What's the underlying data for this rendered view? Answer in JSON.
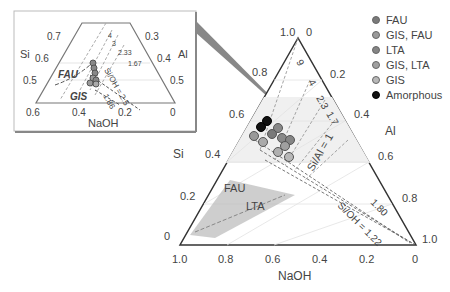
{
  "main": {
    "axis_left_label": "Si",
    "axis_right_label": "Al",
    "axis_bottom_label": "NaOH",
    "bottom_ticks": [
      "1.0",
      "0.8",
      "0.6",
      "0.4",
      "0.2",
      "0"
    ],
    "left_ticks": [
      "0",
      "0.2",
      "0.4",
      "0.6",
      "0.8",
      "1.0"
    ],
    "right_ticks": [
      "0",
      "0.2",
      "0.4",
      "0.6",
      "0.8",
      "1.0"
    ],
    "si_al_labels": [
      "9",
      "4",
      "2.3",
      "1.7"
    ],
    "si_al_eq": "Si/Al = 1",
    "si_oh_labels": [
      "1.80"
    ],
    "si_oh_eq": "Si/OH = 1.22",
    "region_fau": "FAU",
    "region_lta": "LTA"
  },
  "inset": {
    "axis_left_label": "Si",
    "axis_right_label": "Al",
    "axis_bottom_label": "NaOH",
    "bottom_ticks": [
      "0.6",
      "0.4",
      "0.2",
      "0"
    ],
    "left_ticks": [
      "0.5",
      "0.6",
      "0.7"
    ],
    "right_ticks": [
      "0.3",
      "0.4",
      "0.5"
    ],
    "si_al_labels": [
      "4",
      "3",
      "2.33",
      "1.67"
    ],
    "si_oh_eq": "Si/OH = 2.5",
    "si_oh_label2": "1.86",
    "region_fau": "FAU",
    "region_gis": "GIS"
  },
  "legend": {
    "items": [
      {
        "label": "FAU",
        "color": "#7a7a7a"
      },
      {
        "label": "GIS, FAU",
        "color": "#9a9a9a"
      },
      {
        "label": "LTA",
        "color": "#858585"
      },
      {
        "label": "GIS, LTA",
        "color": "#a0a0a0"
      },
      {
        "label": "GIS",
        "color": "#b8b8b8"
      },
      {
        "label": "Amorphous",
        "color": "#111111"
      }
    ]
  }
}
